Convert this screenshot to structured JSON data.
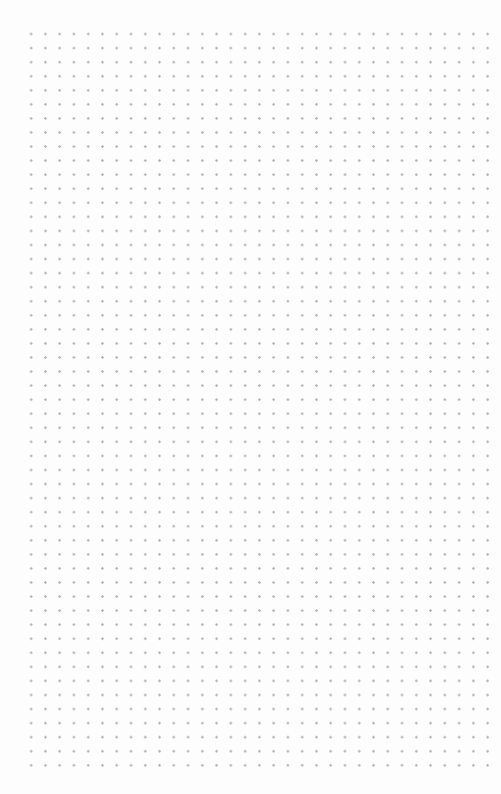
{
  "canvas": {
    "type": "dot-grid",
    "background_color": "#fdfdfd",
    "dot_color": "#b4b4b4",
    "columns": 33,
    "rows": 53,
    "spacing_px": 14
  }
}
